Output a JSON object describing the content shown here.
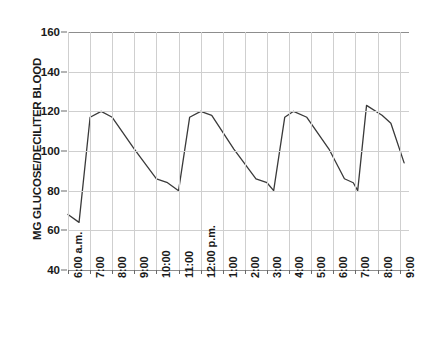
{
  "chart_data": {
    "type": "line",
    "title": "",
    "xlabel": "",
    "ylabel": "MG GLUCOSE/DECILITER BLOOD",
    "ylim": [
      40,
      160
    ],
    "y_ticks": [
      40,
      60,
      80,
      100,
      120,
      140,
      160
    ],
    "grid": true,
    "legend": "none",
    "categories": [
      "6:00 a.m.",
      "7:00",
      "8:00",
      "9:00",
      "10:00",
      "11:00",
      "12:00 p.m.",
      "1:00",
      "2:00",
      "3:00",
      "4:00",
      "5:00",
      "6:00",
      "7:00",
      "8:00",
      "9:00"
    ],
    "x_tick_labels": [
      "6:00 a.m.",
      "7:00",
      "8:00",
      "9:00",
      "10:00",
      "11:00",
      "12:00 p.m.",
      "1:00",
      "2:00",
      "3:00",
      "4:00",
      "5:00",
      "6:00",
      "7:00",
      "8:00",
      "9:00"
    ],
    "series": [
      {
        "name": "Blood glucose",
        "color": "#3a3a3a",
        "points": [
          {
            "x": 6.0,
            "label": "6:00 a.m.",
            "y": 68
          },
          {
            "x": 6.5,
            "label": "6:30 a.m.",
            "y": 64
          },
          {
            "x": 7.0,
            "label": "7:00 a.m.",
            "y": 117
          },
          {
            "x": 7.5,
            "label": "7:30 a.m.",
            "y": 120
          },
          {
            "x": 8.0,
            "label": "8:00 a.m.",
            "y": 117
          },
          {
            "x": 9.0,
            "label": "9:00 a.m.",
            "y": 101
          },
          {
            "x": 10.0,
            "label": "10:00 a.m.",
            "y": 86
          },
          {
            "x": 10.5,
            "label": "10:30 a.m.",
            "y": 84
          },
          {
            "x": 11.0,
            "label": "11:00 a.m.",
            "y": 80
          },
          {
            "x": 11.5,
            "label": "11:30 a.m.",
            "y": 117
          },
          {
            "x": 12.0,
            "label": "12:00 p.m.",
            "y": 120
          },
          {
            "x": 12.5,
            "label": "12:30 p.m.",
            "y": 118
          },
          {
            "x": 13.5,
            "label": "1:30 p.m.",
            "y": 101
          },
          {
            "x": 14.5,
            "label": "2:30 p.m.",
            "y": 86
          },
          {
            "x": 15.0,
            "label": "3:00 p.m.",
            "y": 84
          },
          {
            "x": 15.3,
            "label": "3:20 p.m.",
            "y": 80
          },
          {
            "x": 15.8,
            "label": "3:50 p.m.",
            "y": 117
          },
          {
            "x": 16.2,
            "label": "4:10 p.m.",
            "y": 120
          },
          {
            "x": 16.8,
            "label": "4:50 p.m.",
            "y": 117
          },
          {
            "x": 17.8,
            "label": "5:50 p.m.",
            "y": 101
          },
          {
            "x": 18.5,
            "label": "6:30 p.m.",
            "y": 86
          },
          {
            "x": 18.9,
            "label": "6:55 p.m.",
            "y": 84
          },
          {
            "x": 19.1,
            "label": "7:05 p.m.",
            "y": 80
          },
          {
            "x": 19.5,
            "label": "7:30 p.m.",
            "y": 123
          },
          {
            "x": 20.2,
            "label": "8:10 p.m.",
            "y": 118
          },
          {
            "x": 20.6,
            "label": "8:35 p.m.",
            "y": 114
          },
          {
            "x": 21.2,
            "label": "9:10 p.m.",
            "y": 94
          }
        ]
      }
    ]
  }
}
